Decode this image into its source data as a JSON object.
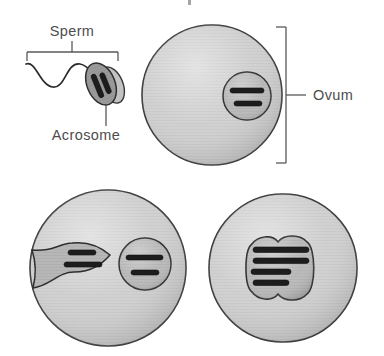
{
  "figure": {
    "title": "",
    "type": "biological-process-diagram",
    "background_color": "#ffffff"
  },
  "labels": {
    "sperm": "Sperm",
    "acrosome": "Acrosome",
    "ovum": "Ovum"
  },
  "colors": {
    "text": "#4d4d4d",
    "outline": "#3a3a3a",
    "cell_fill": "#cdcecd",
    "nucleus_fill": "#b6b7b6",
    "sperm_head_fill": "#9a9b9a",
    "acrosome_fill": "#c2c3c2",
    "chromatin": "#1d1d1d",
    "leader_line": "#585858"
  },
  "panels": [
    {
      "id": "panel-top",
      "name": "sperm-approaching-ovum",
      "elements": [
        {
          "name": "sperm-tail",
          "shape": "sine-wave"
        },
        {
          "name": "sperm-head",
          "shape": "ellipse",
          "chromatin_bars": 2,
          "bar_orientation": "vertical"
        },
        {
          "name": "acrosome",
          "shape": "ellipse"
        },
        {
          "name": "ovum-cell",
          "shape": "circle"
        },
        {
          "name": "ovum-nucleus",
          "shape": "circle",
          "chromatin_bars": 2,
          "bar_orientation": "horizontal"
        }
      ],
      "annotations": [
        "sperm",
        "acrosome",
        "ovum"
      ]
    },
    {
      "id": "panel-bottom-left",
      "name": "sperm-nucleus-inside-ovum",
      "elements": [
        {
          "name": "zygote-cell",
          "shape": "circle"
        },
        {
          "name": "sperm-pronucleus",
          "shape": "funnel-lens",
          "chromatin_bars": 2,
          "bar_orientation": "horizontal"
        },
        {
          "name": "ovum-pronucleus",
          "shape": "circle",
          "chromatin_bars": 2,
          "bar_orientation": "horizontal"
        }
      ],
      "annotations": []
    },
    {
      "id": "panel-bottom-right",
      "name": "fused-pronuclei",
      "elements": [
        {
          "name": "zygote-cell",
          "shape": "circle"
        },
        {
          "name": "fused-nucleus",
          "shape": "two-lobed",
          "chromatin_bars": 4,
          "bar_orientation": "horizontal"
        }
      ],
      "annotations": []
    }
  ]
}
